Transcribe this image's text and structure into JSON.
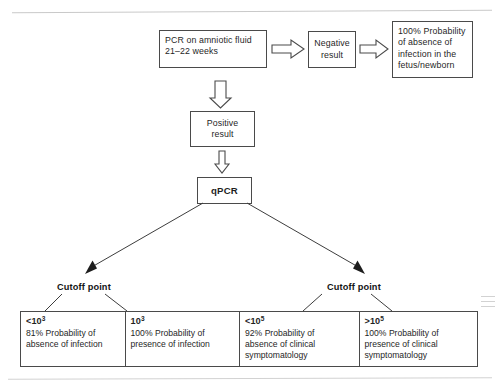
{
  "figure": {
    "type": "flowchart",
    "title_visible": false,
    "colors": {
      "line": "#4a4a4a",
      "text": "#1f1f1f",
      "background": "#ffffff",
      "page_rule": "#c9c9c9"
    }
  },
  "nodes": {
    "pcr_test": {
      "label_lines": [
        "PCR on amniotic fluid",
        "21–22 weeks"
      ],
      "bold": false
    },
    "negative_result": {
      "label_lines": [
        "Negative",
        "result"
      ],
      "bold": false
    },
    "no_infection": {
      "label_lines": [
        "100% Probability",
        "of absence of",
        "infection in the",
        "fetus/newborn"
      ],
      "bold": false
    },
    "positive_result": {
      "label_lines": [
        "Positive",
        "result"
      ],
      "bold": false
    },
    "qpcr": {
      "label_lines": [
        "qPCR"
      ],
      "bold": true
    }
  },
  "branch_labels": {
    "left": "Cutoff point",
    "right": "Cutoff point"
  },
  "results_table": {
    "columns": [
      {
        "threshold": "<10",
        "exponent": "3",
        "body_lines": [
          "81% Probability of",
          "absence of infection"
        ]
      },
      {
        "threshold": "10",
        "exponent": "3",
        "body_lines": [
          "100% Probability of",
          "presence of infection"
        ]
      },
      {
        "threshold": "<10",
        "exponent": "5",
        "body_lines": [
          "92% Probability of",
          "absence of clinical",
          "symptomatology"
        ]
      },
      {
        "threshold": ">10",
        "exponent": "5",
        "body_lines": [
          "100% Probability of",
          "presence of clinical",
          "symptomatology"
        ]
      }
    ]
  },
  "icons": {
    "block_arrow_right_1": "block-arrow-right-icon",
    "block_arrow_right_2": "block-arrow-right-icon",
    "block_arrow_down_1": "block-arrow-down-icon",
    "block_arrow_down_2": "block-arrow-down-icon",
    "branch_arrow_left": "diagonal-arrow-down-left-icon",
    "branch_arrow_right": "diagonal-arrow-down-right-icon"
  }
}
